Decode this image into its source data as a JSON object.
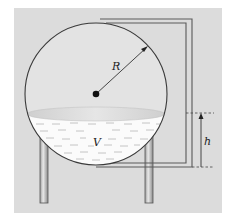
{
  "diagram": {
    "labels": {
      "radius": "R",
      "volume": "V",
      "height": "h"
    },
    "colors": {
      "background": "#ffffff",
      "panel": "#dcdcdc",
      "sphere_fill": "#e3e3e3",
      "liquid": "#fbfbfb",
      "liquid_surface": "#d2d2d2",
      "outline": "#3a3a3a",
      "pipe": "#5a5a5a",
      "leg_fill": "#bdbdbd"
    },
    "geometry": {
      "sphere_center": [
        96,
        94
      ],
      "sphere_radius": 71,
      "liquid_level_y": 114,
      "legs": [
        {
          "x": 40,
          "width": 8,
          "top": 140,
          "bottom": 203
        },
        {
          "x": 145,
          "width": 8,
          "top": 140,
          "bottom": 203
        }
      ],
      "pipe_outer_x": 192,
      "pipe_inner_x": 186,
      "pipe_top_y": 19,
      "pipe_bottom_y": 167,
      "h_arrow_x": 201,
      "h_top_y": 113,
      "h_bottom_y": 167
    }
  }
}
